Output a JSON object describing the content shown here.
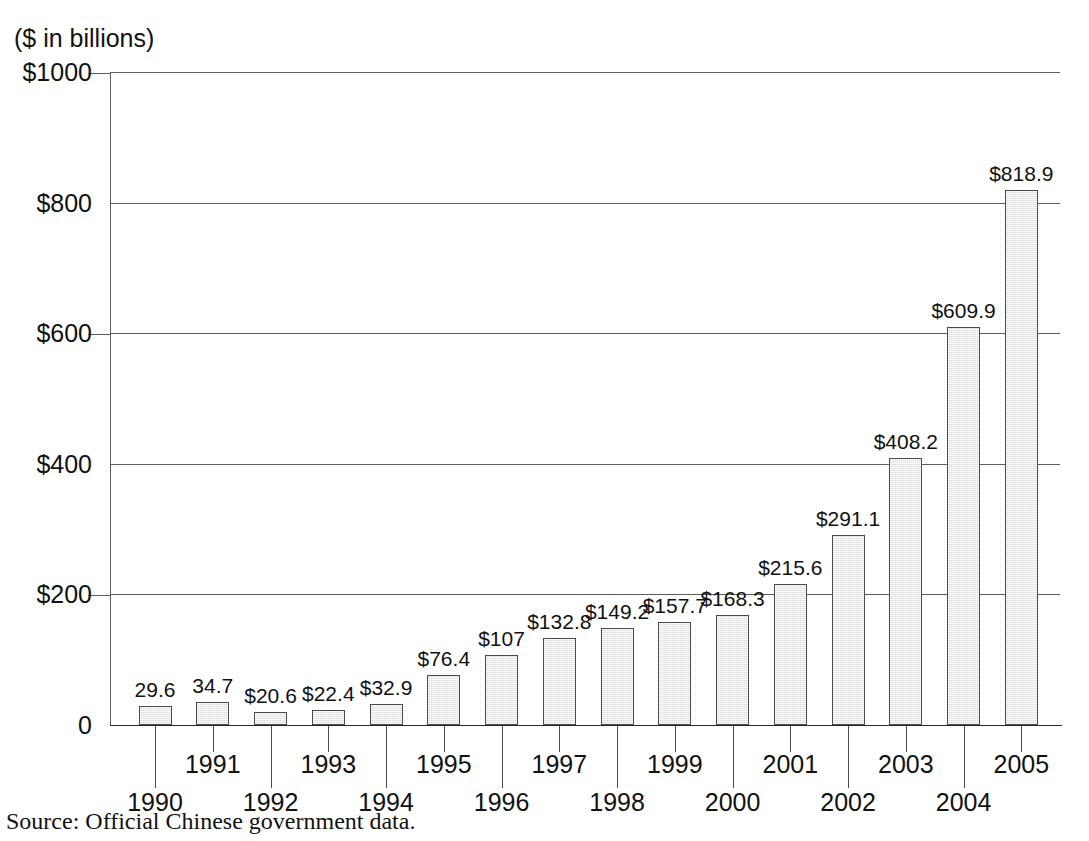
{
  "figure": {
    "units_caption": "($ in billions)",
    "source_note": "Source: Official Chinese government data."
  },
  "chart_data": {
    "type": "bar",
    "title": "",
    "subtitle": "",
    "xlabel": "",
    "ylabel": "($ in billions)",
    "ylim": [
      0,
      1000
    ],
    "grid": true,
    "legend": "none",
    "y_ticks": [
      0,
      200,
      400,
      600,
      800,
      1000
    ],
    "y_tick_labels": [
      "0",
      "$200",
      "$400",
      "$600",
      "$800",
      "$1000"
    ],
    "categories": [
      "1990",
      "1991",
      "1992",
      "1993",
      "1994",
      "1995",
      "1996",
      "1997",
      "1998",
      "1999",
      "2000",
      "2001",
      "2002",
      "2003",
      "2004",
      "2005"
    ],
    "values": [
      29.6,
      34.7,
      20.6,
      22.4,
      32.9,
      76.4,
      107,
      132.8,
      149.2,
      157.7,
      168.3,
      215.6,
      291.1,
      408.2,
      609.9,
      818.9
    ],
    "data_labels": [
      "29.6",
      "34.7",
      "$20.6",
      "$22.4",
      "$32.9",
      "$76.4",
      "$107",
      "$132.8",
      "$149.2",
      "$157.7",
      "$168.3",
      "$215.6",
      "$291.1",
      "$408.2",
      "$609.9",
      "$818.9"
    ],
    "bar_fill_color": "#d9d9d9",
    "bar_border_color": "#4a4a4a",
    "axis_color": "#5d5d5d",
    "text_color": "#111111"
  }
}
